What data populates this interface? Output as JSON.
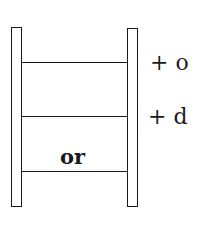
{
  "diagram": {
    "type": "word-ladder",
    "rungs_top_to_bottom": [
      {
        "word": "",
        "side_label": "+ o"
      },
      {
        "word": "",
        "side_label": "+ d"
      },
      {
        "word": "or",
        "side_label": ""
      }
    ],
    "labels": {
      "rung1_right": "+ o",
      "rung2_right": "+ d",
      "rung3_word": "or"
    },
    "colors": {
      "ink": "#1a1a1a",
      "background": "#ffffff"
    }
  }
}
